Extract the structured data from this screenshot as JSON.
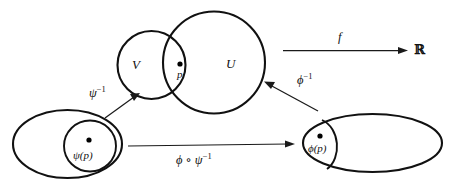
{
  "diagram": {
    "background_color": "#ffffff",
    "stroke_color": "#111111",
    "regions": [
      {
        "name": "manifold-chart-domain-V",
        "label": "V",
        "shape": "circle"
      },
      {
        "name": "manifold-chart-domain-U",
        "label": "U",
        "shape": "circle"
      },
      {
        "name": "coordinate-domain-psi",
        "label": "",
        "shape": "ellipse"
      },
      {
        "name": "coordinate-domain-phi",
        "label": "",
        "shape": "ellipse"
      }
    ],
    "points": [
      {
        "name": "point-p",
        "label": "p"
      },
      {
        "name": "point-psi-p",
        "label_prefix": "ψ(",
        "label_suffix": ")",
        "label": "ψ(p)"
      },
      {
        "name": "point-phi-p",
        "label_prefix": "ϕ(",
        "label_suffix": ")",
        "label": "ϕ(p)"
      }
    ],
    "labels": {
      "set_v": "V",
      "set_u": "U",
      "point_p": "p",
      "psi_of_p": "ψ(p)",
      "phi_of_p": "ϕ(p)",
      "codomain_r": "ℝ"
    },
    "arrows": [
      {
        "name": "arrow-f",
        "label": "f",
        "label_base": "f",
        "label_exponent": "",
        "direction": "right",
        "from": "U",
        "to": "ℝ"
      },
      {
        "name": "arrow-phi-inverse",
        "label": "ϕ⁻¹",
        "label_base": "ϕ",
        "label_exponent": "−1",
        "direction": "up-left",
        "from": "phi-codomain-ellipse",
        "to": "U"
      },
      {
        "name": "arrow-psi-inverse",
        "label": "ψ⁻¹",
        "label_base": "ψ",
        "label_exponent": "−1",
        "direction": "up-right",
        "from": "psi-codomain-ellipse",
        "to": "V"
      },
      {
        "name": "arrow-transition-map",
        "label": "ϕ ∘ ψ⁻¹",
        "label_base": "ϕ ∘ ψ",
        "label_exponent": "−1",
        "direction": "right",
        "from": "psi-codomain-ellipse",
        "to": "phi-codomain-ellipse"
      }
    ]
  }
}
